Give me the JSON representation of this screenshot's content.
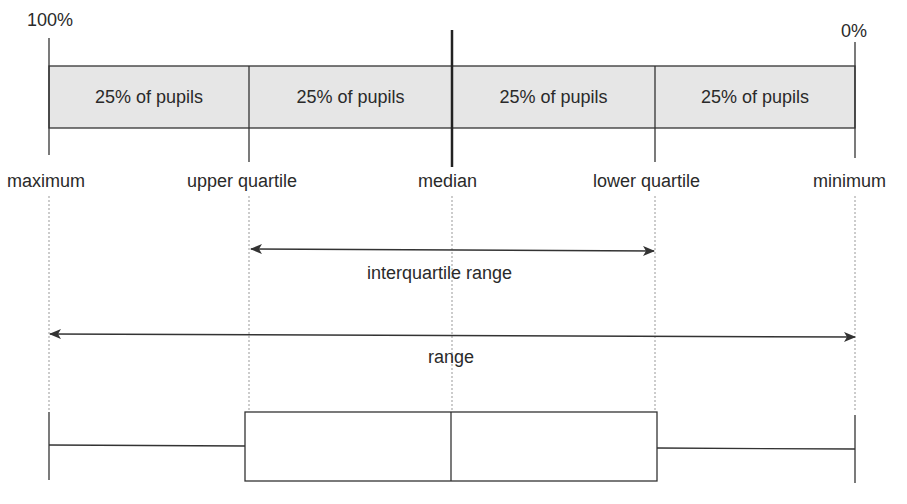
{
  "diagram": {
    "type": "box-plot-explanation",
    "scale_labels": {
      "left": "100%",
      "right": "0%"
    },
    "segments": [
      {
        "label": "25% of pupils"
      },
      {
        "label": "25% of pupils"
      },
      {
        "label": "25% of pupils"
      },
      {
        "label": "25% of pupils"
      }
    ],
    "markers": {
      "maximum": "maximum",
      "upper_quartile": "upper quartile",
      "median": "median",
      "lower_quartile": "lower quartile",
      "minimum": "minimum"
    },
    "spans": {
      "interquartile": "interquartile range",
      "range": "range"
    },
    "colors": {
      "band_fill": "#e6e6e6",
      "line": "#333333",
      "guide": "#999999"
    }
  }
}
